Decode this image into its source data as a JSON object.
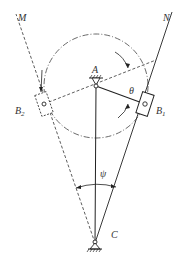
{
  "diagram": {
    "labels": {
      "M": "M",
      "N": "N",
      "A": "A",
      "B1": "B",
      "B1_sub": "1",
      "B2": "B",
      "B2_sub": "2",
      "C": "C",
      "theta": "θ",
      "psi": "ψ"
    },
    "points": {
      "A": [
        96,
        86
      ],
      "C": [
        95,
        243
      ],
      "B1": [
        145,
        104
      ],
      "B2": [
        44,
        104
      ]
    },
    "crank_circle_radius": 52,
    "colors": {
      "line": "#222222",
      "label": "#333333",
      "background": "#ffffff"
    }
  }
}
